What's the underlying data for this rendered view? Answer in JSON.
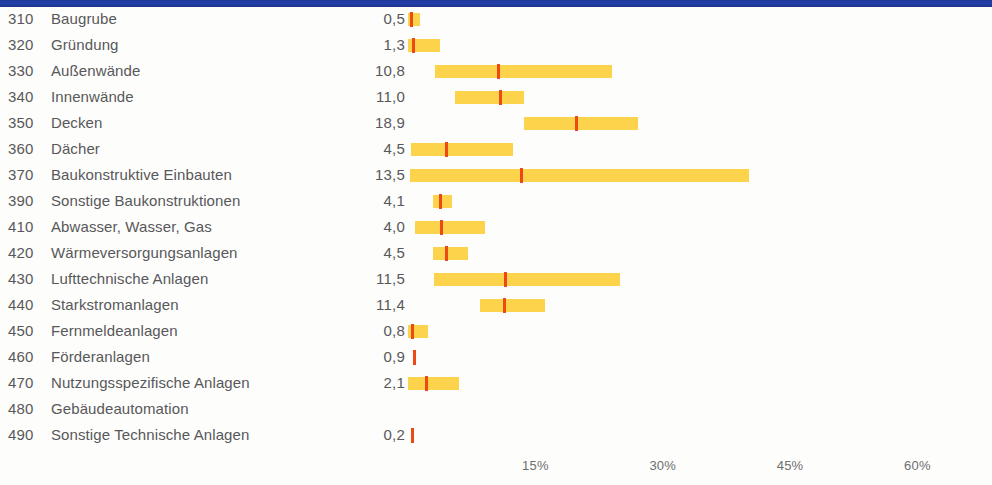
{
  "chart_data": {
    "type": "bar",
    "xlabel": "",
    "ylabel": "",
    "xlim": [
      0,
      66
    ],
    "xticks": [
      15,
      30,
      45,
      60
    ],
    "xtick_labels": [
      "15%",
      "30%",
      "45%",
      "60%"
    ],
    "grid": false,
    "legend": null,
    "value_column_header": "",
    "pixel_axis": {
      "x_at_zero": 408,
      "px_per_percent": 8.49
    },
    "rows": [
      {
        "code": "310",
        "label": "Baugrube",
        "value": "0,5",
        "value_num": 0.5,
        "range_low": 0.0,
        "range_high": 1.4,
        "marker": 0.4
      },
      {
        "code": "320",
        "label": "Gründung",
        "value": "1,3",
        "value_num": 1.3,
        "range_low": 0.0,
        "range_high": 3.8,
        "marker": 0.6
      },
      {
        "code": "330",
        "label": "Außenwände",
        "value": "10,8",
        "value_num": 10.8,
        "range_low": 3.2,
        "range_high": 24.0,
        "marker": 10.6
      },
      {
        "code": "340",
        "label": "Innenwände",
        "value": "11,0",
        "value_num": 11.0,
        "range_low": 5.5,
        "range_high": 13.7,
        "marker": 10.8
      },
      {
        "code": "350",
        "label": "Decken",
        "value": "18,9",
        "value_num": 18.9,
        "range_low": 13.7,
        "range_high": 27.1,
        "marker": 19.8
      },
      {
        "code": "360",
        "label": "Dächer",
        "value": "4,5",
        "value_num": 4.5,
        "range_low": 0.4,
        "range_high": 12.4,
        "marker": 4.5
      },
      {
        "code": "370",
        "label": "Baukonstruktive Einbauten",
        "value": "13,5",
        "value_num": 13.5,
        "range_low": 0.2,
        "range_high": 40.2,
        "marker": 13.3
      },
      {
        "code": "390",
        "label": "Sonstige Baukonstruktionen",
        "value": "4,1",
        "value_num": 4.1,
        "range_low": 2.9,
        "range_high": 5.2,
        "marker": 3.8
      },
      {
        "code": "410",
        "label": "Abwasser, Wasser, Gas",
        "value": "4,0",
        "value_num": 4.0,
        "range_low": 0.8,
        "range_high": 9.1,
        "marker": 3.9
      },
      {
        "code": "420",
        "label": "Wärmeversorgungsanlagen",
        "value": "4,5",
        "value_num": 4.5,
        "range_low": 2.9,
        "range_high": 7.1,
        "marker": 4.5
      },
      {
        "code": "430",
        "label": "Lufttechnische Anlagen",
        "value": "11,5",
        "value_num": 11.5,
        "range_low": 3.1,
        "range_high": 25.0,
        "marker": 11.4
      },
      {
        "code": "440",
        "label": "Starkstromanlagen",
        "value": "11,4",
        "value_num": 11.4,
        "range_low": 8.5,
        "range_high": 16.1,
        "marker": 11.3
      },
      {
        "code": "450",
        "label": "Fernmeldeanlagen",
        "value": "0,8",
        "value_num": 0.8,
        "range_low": 0.0,
        "range_high": 2.4,
        "marker": 0.5
      },
      {
        "code": "460",
        "label": "Förderanlagen",
        "value": "0,9",
        "value_num": 0.9,
        "range_low": null,
        "range_high": null,
        "marker": 0.7
      },
      {
        "code": "470",
        "label": "Nutzungsspezifische Anlagen",
        "value": "2,1",
        "value_num": 2.1,
        "range_low": 0.0,
        "range_high": 6.0,
        "marker": 2.1
      },
      {
        "code": "480",
        "label": "Gebäudeautomation",
        "value": "",
        "value_num": null,
        "range_low": null,
        "range_high": null,
        "marker": null
      },
      {
        "code": "490",
        "label": "Sonstige Technische Anlagen",
        "value": "0,2",
        "value_num": 0.2,
        "range_low": null,
        "range_high": null,
        "marker": 0.5
      }
    ],
    "colors": {
      "range_bar": "#fcd34a",
      "marker": "#eb4a14",
      "header_band": "#1f3b9b",
      "text": "#58585a",
      "axis_text": "#6e6e70",
      "background": "#ffffff"
    }
  }
}
